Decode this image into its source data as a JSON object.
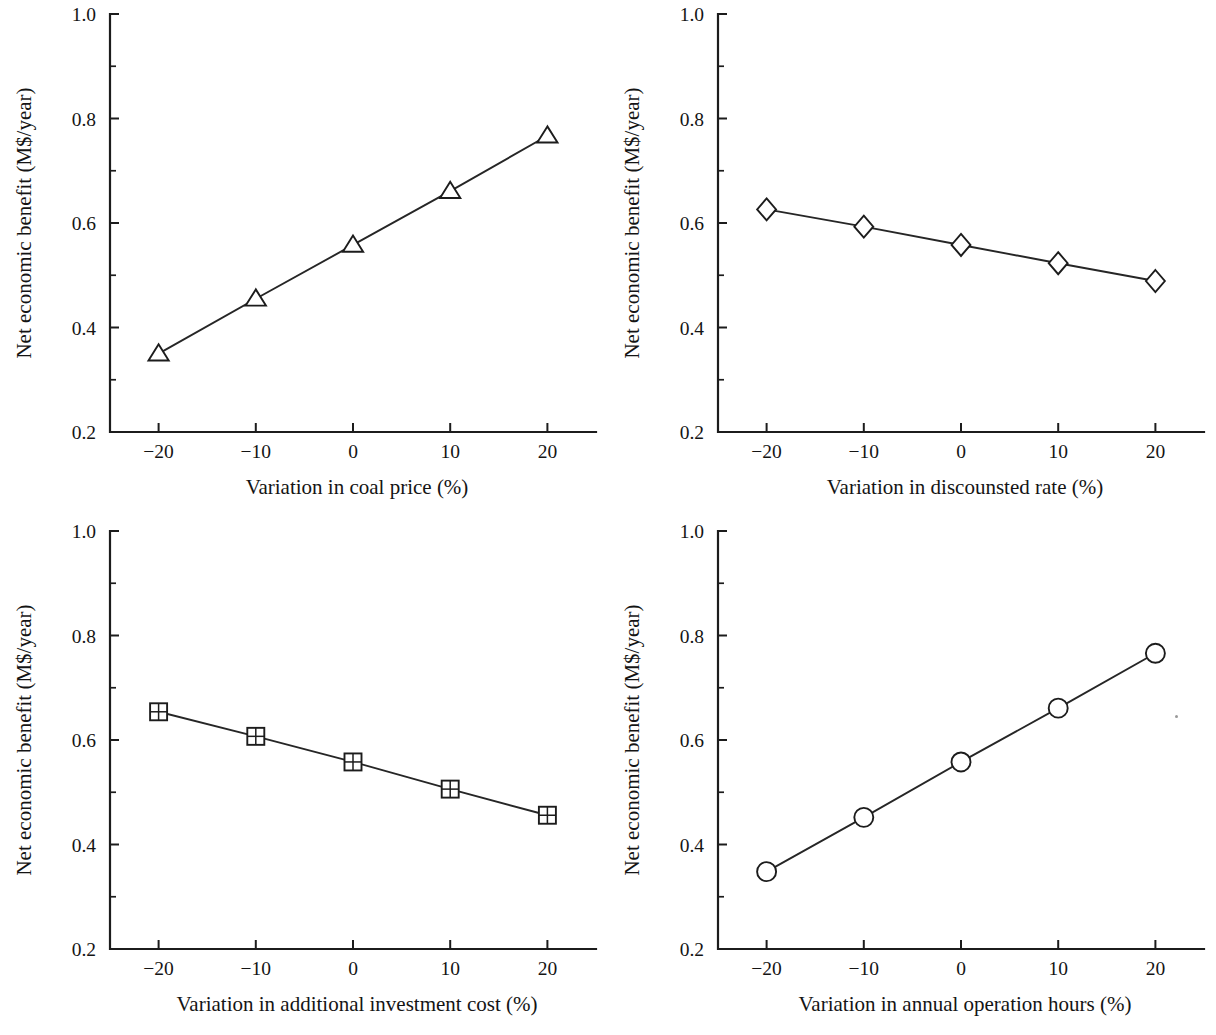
{
  "figure": {
    "background_color": "#ffffff",
    "ink_color": "#1c1c1c",
    "panel_count": 4,
    "shared_y_axis_label": "Net economic benefit (M$/year)",
    "shared_y_ticks": [
      "1.0",
      "0.8",
      "0.6",
      "0.4",
      "0.2"
    ],
    "shared_x_ticks": [
      "−20",
      "−10",
      "0",
      "10",
      "20"
    ]
  },
  "chart_data": [
    {
      "id": "coal-price",
      "position": "top-left",
      "type": "line",
      "title": "",
      "xlabel": "Variation in coal price (%)",
      "ylabel": "Net economic benefit (M$/year)",
      "x": [
        -20,
        -10,
        0,
        10,
        20
      ],
      "values": [
        0.35,
        0.455,
        0.558,
        0.661,
        0.767
      ],
      "categories": [
        "−20",
        "−10",
        "0",
        "10",
        "20"
      ],
      "xtick_labels": [
        "−20",
        "−10",
        "0",
        "10",
        "20"
      ],
      "ytick_labels": [
        "0.2",
        "0.4",
        "0.6",
        "0.8",
        "1.0"
      ],
      "xlim": [
        -25,
        25
      ],
      "ylim": [
        0.2,
        1.0
      ],
      "marker": "triangle-up-open",
      "line_color": "#262626",
      "grid": false,
      "legend": null,
      "minor_ticks_y": true,
      "minor_ticks_x": false
    },
    {
      "id": "discounted-rate",
      "position": "top-right",
      "type": "line",
      "title": "",
      "xlabel": "Variation in discounsted rate (%)",
      "ylabel": "Net economic benefit (M$/year)",
      "x": [
        -20,
        -10,
        0,
        10,
        20
      ],
      "values": [
        0.626,
        0.593,
        0.558,
        0.523,
        0.489
      ],
      "categories": [
        "−20",
        "−10",
        "0",
        "10",
        "20"
      ],
      "xtick_labels": [
        "−20",
        "−10",
        "0",
        "10",
        "20"
      ],
      "ytick_labels": [
        "0.2",
        "0.4",
        "0.6",
        "0.8",
        "1.0"
      ],
      "xlim": [
        -25,
        25
      ],
      "ylim": [
        0.2,
        1.0
      ],
      "marker": "diamond-open",
      "line_color": "#262626",
      "grid": false,
      "legend": null,
      "minor_ticks_y": true,
      "minor_ticks_x": false
    },
    {
      "id": "additional-investment-cost",
      "position": "bottom-left",
      "type": "line",
      "title": "",
      "xlabel": "Variation in additional investment cost (%)",
      "ylabel": "Net economic benefit (M$/year)",
      "x": [
        -20,
        -10,
        0,
        10,
        20
      ],
      "values": [
        0.654,
        0.607,
        0.558,
        0.506,
        0.456
      ],
      "categories": [
        "−20",
        "−10",
        "0",
        "10",
        "20"
      ],
      "xtick_labels": [
        "−20",
        "−10",
        "0",
        "10",
        "20"
      ],
      "ytick_labels": [
        "0.2",
        "0.4",
        "0.6",
        "0.8",
        "1.0"
      ],
      "xlim": [
        -25,
        25
      ],
      "ylim": [
        0.2,
        1.0
      ],
      "marker": "square-crossed-open",
      "line_color": "#262626",
      "grid": false,
      "legend": null,
      "minor_ticks_y": true,
      "minor_ticks_x": false
    },
    {
      "id": "annual-operation-hours",
      "position": "bottom-right",
      "type": "line",
      "title": "",
      "xlabel": "Variation in annual operation hours (%)",
      "ylabel": "Net economic benefit (M$/year)",
      "x": [
        -20,
        -10,
        0,
        10,
        20
      ],
      "values": [
        0.348,
        0.452,
        0.558,
        0.661,
        0.766
      ],
      "categories": [
        "−20",
        "−10",
        "0",
        "10",
        "20"
      ],
      "xtick_labels": [
        "−20",
        "−10",
        "0",
        "10",
        "20"
      ],
      "ytick_labels": [
        "0.2",
        "0.4",
        "0.6",
        "0.8",
        "1.0"
      ],
      "xlim": [
        -25,
        25
      ],
      "ylim": [
        0.2,
        1.0
      ],
      "marker": "circle-open",
      "line_color": "#262626",
      "grid": false,
      "legend": null,
      "minor_ticks_y": true,
      "minor_ticks_x": false
    }
  ]
}
